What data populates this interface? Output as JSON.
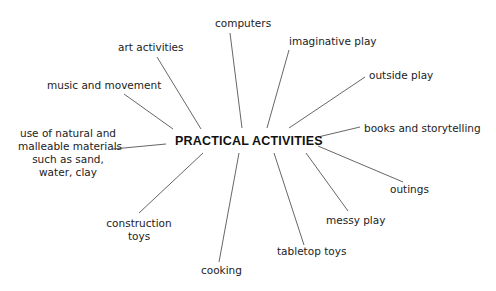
{
  "diagram": {
    "type": "spider",
    "center": "PRACTICAL ACTIVITIES",
    "branches": [
      {
        "label": "computers"
      },
      {
        "label": "imaginative play"
      },
      {
        "label": "outside play"
      },
      {
        "label": "books and storytelling"
      },
      {
        "label": "outings"
      },
      {
        "label": "messy play"
      },
      {
        "label": "tabletop toys"
      },
      {
        "label": "cooking"
      },
      {
        "label": "construction toys",
        "lines": [
          "construction",
          "toys"
        ]
      },
      {
        "label": "use of natural and malleable materials such as sand, water, clay",
        "lines": [
          "use of natural and",
          "malleable materials",
          "such as sand,",
          "water, clay"
        ]
      },
      {
        "label": "music and movement"
      },
      {
        "label": "art activities"
      }
    ]
  }
}
